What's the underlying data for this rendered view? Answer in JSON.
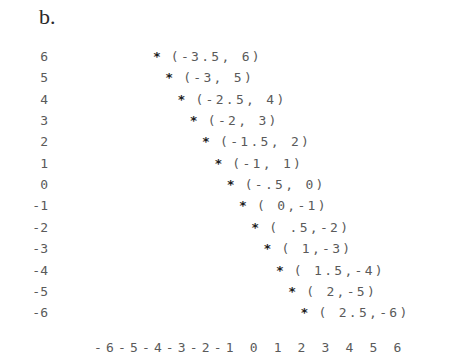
{
  "title": "b.",
  "chart_data": {
    "type": "scatter",
    "title": "b.",
    "xlabel": "",
    "ylabel": "",
    "xlim": [
      -6,
      6
    ],
    "ylim": [
      -6,
      6
    ],
    "grid": false,
    "marker": "*",
    "x_ticks": [
      "-6",
      "-5",
      "-4",
      "-3",
      "-2",
      "-1",
      "0",
      "1",
      "2",
      "3",
      "4",
      "5",
      "6"
    ],
    "y_ticks": [
      "6",
      "5",
      "4",
      "3",
      "2",
      "1",
      "0",
      "-1",
      "-2",
      "-3",
      "-4",
      "-5",
      "-6"
    ],
    "x_axis_text": "-6-5-4-3-2-1 0 1 2 3 4 5 6",
    "points": [
      {
        "x": -3.5,
        "y": 6,
        "label": "(-3.5, 6)"
      },
      {
        "x": -3,
        "y": 5,
        "label": "(-3, 5)"
      },
      {
        "x": -2.5,
        "y": 4,
        "label": "(-2.5, 4)"
      },
      {
        "x": -2,
        "y": 3,
        "label": "(-2, 3)"
      },
      {
        "x": -1.5,
        "y": 2,
        "label": "(-1.5, 2)"
      },
      {
        "x": -1,
        "y": 1,
        "label": "(-1, 1)"
      },
      {
        "x": -0.5,
        "y": 0,
        "label": "(-.5, 0)"
      },
      {
        "x": 0,
        "y": -1,
        "label": "( 0,-1)"
      },
      {
        "x": 0.5,
        "y": -2,
        "label": "( .5,-2)"
      },
      {
        "x": 1,
        "y": -3,
        "label": "( 1,-3)"
      },
      {
        "x": 1.5,
        "y": -4,
        "label": "( 1.5,-4)"
      },
      {
        "x": 2,
        "y": -5,
        "label": "( 2,-5)"
      },
      {
        "x": 2.5,
        "y": -6,
        "label": "( 2.5,-6)"
      }
    ],
    "x": [
      -3.5,
      -3,
      -2.5,
      -2,
      -1.5,
      -1,
      -0.5,
      0,
      0.5,
      1,
      1.5,
      2,
      2.5
    ],
    "y": [
      6,
      5,
      4,
      3,
      2,
      1,
      0,
      -1,
      -2,
      -3,
      -4,
      -5,
      -6
    ]
  },
  "colors": {
    "background": "#ffffff",
    "text": "#5a5a5a",
    "marker": "#1e1e1e"
  }
}
